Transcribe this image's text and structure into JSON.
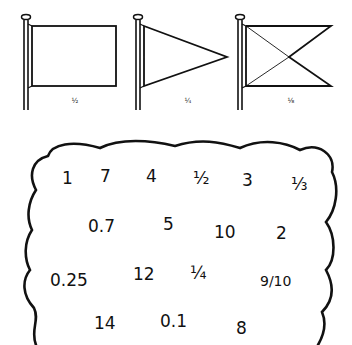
{
  "flags": [
    {
      "shape": "rectangle",
      "label": "½"
    },
    {
      "shape": "pennant-triangle",
      "label": "¼"
    },
    {
      "shape": "swallowtail-crossed",
      "label": "⅛"
    }
  ],
  "cloud": {
    "rows": [
      [
        "1",
        "7",
        "4",
        "½",
        "3",
        "⅓"
      ],
      [
        "0.7",
        "5",
        "10",
        "2"
      ],
      [
        "0.25",
        "12",
        "¼",
        "9/10"
      ],
      [
        "14",
        "0.1",
        "8"
      ]
    ]
  }
}
